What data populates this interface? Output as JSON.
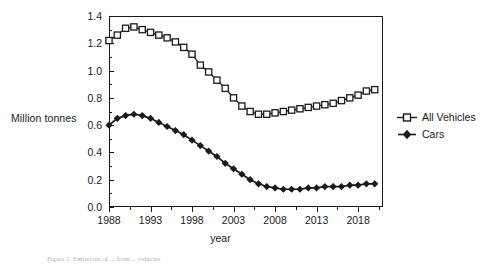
{
  "chart_data": {
    "type": "line",
    "title": "",
    "xlabel": "year",
    "ylabel": "Million tonnes",
    "xlim": [
      1988,
      2021
    ],
    "ylim": [
      0.0,
      1.4
    ],
    "grid": false,
    "legend_position": "right",
    "x_tick_labels": [
      "1988",
      "1993",
      "1998",
      "2003",
      "2008",
      "2013",
      "2018"
    ],
    "x_tick_values": [
      1988,
      1993,
      1998,
      2003,
      2008,
      2013,
      2018
    ],
    "y_tick_labels": [
      "0.0",
      "0.2",
      "0.4",
      "0.6",
      "0.8",
      "1.0",
      "1.2",
      "1.4"
    ],
    "y_tick_values": [
      0.0,
      0.2,
      0.4,
      0.6,
      0.8,
      1.0,
      1.2,
      1.4
    ],
    "x": [
      1988,
      1989,
      1990,
      1991,
      1992,
      1993,
      1994,
      1995,
      1996,
      1997,
      1998,
      1999,
      2000,
      2001,
      2002,
      2003,
      2004,
      2005,
      2006,
      2007,
      2008,
      2009,
      2010,
      2011,
      2012,
      2013,
      2014,
      2015,
      2016,
      2017,
      2018,
      2019,
      2020
    ],
    "series": [
      {
        "name": "All Vehicles",
        "marker": "open-square",
        "color": "#1a1a1a",
        "values": [
          1.22,
          1.26,
          1.31,
          1.32,
          1.3,
          1.28,
          1.26,
          1.24,
          1.21,
          1.17,
          1.12,
          1.04,
          0.99,
          0.93,
          0.87,
          0.8,
          0.74,
          0.7,
          0.68,
          0.68,
          0.69,
          0.7,
          0.71,
          0.72,
          0.73,
          0.74,
          0.75,
          0.76,
          0.78,
          0.8,
          0.82,
          0.85,
          0.86
        ]
      },
      {
        "name": "Cars",
        "marker": "filled-diamond",
        "color": "#1a1a1a",
        "values": [
          0.6,
          0.65,
          0.67,
          0.68,
          0.67,
          0.65,
          0.62,
          0.59,
          0.56,
          0.53,
          0.49,
          0.45,
          0.41,
          0.37,
          0.32,
          0.28,
          0.24,
          0.2,
          0.17,
          0.15,
          0.14,
          0.13,
          0.13,
          0.13,
          0.14,
          0.14,
          0.15,
          0.15,
          0.15,
          0.16,
          0.16,
          0.17,
          0.17
        ]
      }
    ]
  },
  "axis": {
    "y_title": "Million tonnes",
    "x_title": "year"
  },
  "legend": {
    "entries": [
      {
        "label": "All Vehicles",
        "marker": "open-square"
      },
      {
        "label": "Cars",
        "marker": "filled-diamond"
      }
    ]
  },
  "caption": {
    "text": "Figure 2. Emissions of ... from ... vehicles"
  }
}
